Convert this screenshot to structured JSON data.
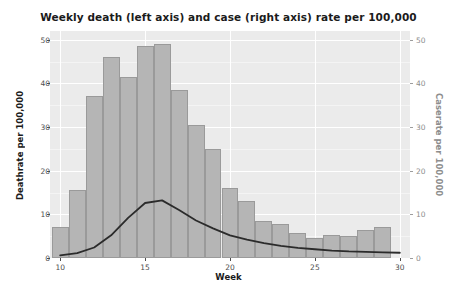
{
  "chart_data": {
    "type": "bar",
    "title": "Weekly death (left axis) and case (right axis) rate per 100,000",
    "xlabel": "Week",
    "ylabel": "Deathrate per 100,000",
    "ylabel_right": "Caserate per 100,000",
    "xlim": [
      9.4,
      30.6
    ],
    "ylim": [
      0,
      52
    ],
    "ylim_right": [
      0,
      52
    ],
    "xticks": [
      10,
      15,
      20,
      25,
      30
    ],
    "yticks": [
      0,
      10,
      20,
      30,
      40,
      50
    ],
    "yticks_right": [
      0,
      10,
      20,
      30,
      40,
      50
    ],
    "grid": true,
    "legend": "none",
    "categories": [
      10,
      11,
      12,
      13,
      14,
      15,
      16,
      17,
      18,
      19,
      20,
      21,
      22,
      23,
      24,
      25,
      26,
      27,
      28,
      29,
      30
    ],
    "series": [
      {
        "name": "Caserate per 100,000",
        "type": "bar",
        "axis": "right",
        "color": "#b5b5b5",
        "edge_color": "#9a9a9a",
        "values": [
          7.0,
          15.5,
          37.0,
          46.0,
          41.5,
          48.5,
          49.0,
          38.5,
          30.5,
          25.0,
          16.0,
          13.0,
          8.5,
          7.8,
          5.8,
          4.6,
          5.2,
          5.1,
          6.4,
          7.0,
          0
        ]
      },
      {
        "name": "Deathrate per 100,000",
        "type": "line",
        "axis": "left",
        "color": "#2b2b2b",
        "values": [
          0.6,
          1.1,
          2.4,
          5.2,
          9.2,
          12.6,
          13.2,
          11.0,
          8.6,
          6.8,
          5.2,
          4.2,
          3.4,
          2.8,
          2.3,
          2.0,
          1.7,
          1.5,
          1.4,
          1.3,
          1.2
        ]
      }
    ]
  },
  "axis_colors": {
    "left_label": "#1b1b1b",
    "right_label": "#8d8d8d",
    "panel_bg": "#ebebeb",
    "grid": "#ffffff"
  }
}
